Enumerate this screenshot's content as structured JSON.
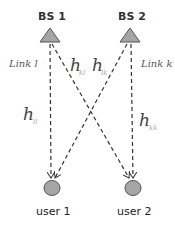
{
  "base_stations": [
    {
      "label": "BS 1",
      "x": 50,
      "y": 35
    },
    {
      "label": "BS 2",
      "x": 130,
      "y": 35
    }
  ],
  "users": [
    {
      "label": "user 1",
      "x": 52,
      "y": 188
    },
    {
      "label": "user 2",
      "x": 133,
      "y": 188
    }
  ],
  "links": {
    "left_label": "Link l",
    "right_label": "Link k"
  },
  "channels": {
    "h_ll": {
      "main": "h",
      "sub": "ll"
    },
    "h_kl": {
      "main": "h",
      "sub": "kl"
    },
    "h_lk": {
      "main": "h",
      "sub": "lk"
    },
    "h_kk": {
      "main": "h",
      "sub": "kk"
    }
  },
  "colors": {
    "node_fill": "#a6a6a6",
    "node_stroke": "#555555",
    "line": "#333333"
  }
}
